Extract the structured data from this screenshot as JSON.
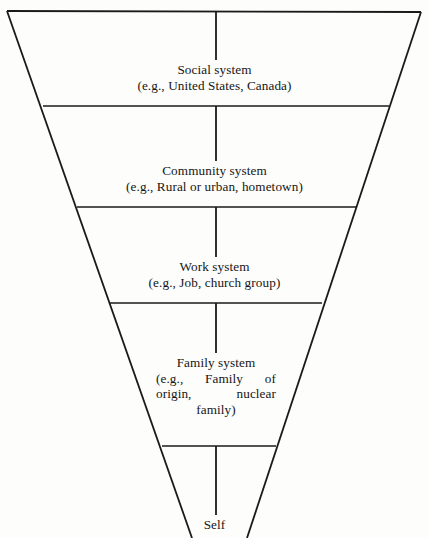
{
  "diagram": {
    "type": "inverted-funnel",
    "stroke_color": "#1a1a1a",
    "background_color": "#fdfdfb",
    "tiers": [
      {
        "id": "social",
        "title": "Social system",
        "example": "(e.g., United States, Canada)"
      },
      {
        "id": "community",
        "title": "Community system",
        "example": "(e.g., Rural or urban, hometown)"
      },
      {
        "id": "work",
        "title": "Work system",
        "example": "(e.g., Job, church group)"
      },
      {
        "id": "family",
        "title": "Family system",
        "example": "(e.g., Family of origin, nuclear family)"
      },
      {
        "id": "self",
        "title": "Self",
        "example": ""
      }
    ]
  }
}
